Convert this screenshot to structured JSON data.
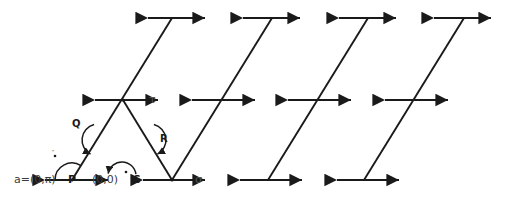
{
  "figure": {
    "title_visible": false,
    "background_color": "#ffffff",
    "stroke_color": "#1a1a1a",
    "width": 506,
    "height": 205,
    "labels": {
      "left_point_coord": "a=(0,π)",
      "left_point_name": "P",
      "origin_coord": "(0,0)",
      "origin_name": "S",
      "arc_q": "Q",
      "arc_r": "R",
      "tau": "τ",
      "sigma": "σ",
      "prime_tick": "′"
    }
  },
  "chart_data": {
    "type": "diagram",
    "title": "",
    "xlabel": "",
    "ylabel": "",
    "grid": false,
    "legend": "none",
    "axis_lines": [
      {
        "name": "bottom-row",
        "level": "bottom",
        "y": 180,
        "segments": [
          {
            "x1": 45,
            "x2": 108
          },
          {
            "x1": 143,
            "x2": 205
          },
          {
            "x1": 240,
            "x2": 302
          },
          {
            "x1": 337,
            "x2": 399
          }
        ]
      },
      {
        "name": "middle-row",
        "level": "middle",
        "y": 100,
        "segments": [
          {
            "x1": 95,
            "x2": 158
          },
          {
            "x1": 192,
            "x2": 255
          },
          {
            "x1": 288,
            "x2": 351
          },
          {
            "x1": 385,
            "x2": 448
          }
        ]
      },
      {
        "name": "top-row",
        "level": "top",
        "y": 18,
        "segments": [
          {
            "x1": 148,
            "x2": 205
          },
          {
            "x1": 243,
            "x2": 300
          },
          {
            "x1": 339,
            "x2": 396
          },
          {
            "x1": 434,
            "x2": 491
          }
        ]
      }
    ],
    "diagonals": [
      {
        "name": "diag-1-up",
        "x1": 72,
        "y1": 180,
        "x2": 172,
        "y2": 18
      },
      {
        "name": "diag-1-down",
        "x1": 123,
        "y1": 100,
        "x2": 172,
        "y2": 180
      },
      {
        "name": "diag-2-up",
        "x1": 172,
        "y1": 180,
        "x2": 272,
        "y2": 18
      },
      {
        "name": "diag-3-up",
        "x1": 268,
        "y1": 180,
        "x2": 368,
        "y2": 18
      },
      {
        "name": "diag-4-up",
        "x1": 364,
        "y1": 180,
        "x2": 464,
        "y2": 18
      }
    ],
    "vertices": [
      {
        "name": "P",
        "x": 72,
        "y": 180
      },
      {
        "name": "tau",
        "x": 123,
        "y": 100
      },
      {
        "name": "sigma",
        "x": 172,
        "y": 180
      }
    ],
    "arcs": [
      {
        "name": "arc-P",
        "label": "",
        "center_x": 72,
        "center_y": 180,
        "radius": 17,
        "direction": "counterclockwise"
      },
      {
        "name": "arc-Q",
        "label": "Q",
        "center_x": 98,
        "center_y": 140,
        "radius": 16,
        "direction": "clockwise"
      },
      {
        "name": "arc-R",
        "label": "R",
        "center_x": 150,
        "center_y": 140,
        "radius": 16,
        "direction": "counterclockwise"
      },
      {
        "name": "arc-S",
        "label": "S",
        "center_x": 122,
        "center_y": 176,
        "radius": 14,
        "direction": "counterclockwise"
      }
    ],
    "points": [
      {
        "name": "origin-dot",
        "x": 126,
        "y": 172
      },
      {
        "name": "prime-tick",
        "x": 55,
        "y": 156
      }
    ]
  }
}
